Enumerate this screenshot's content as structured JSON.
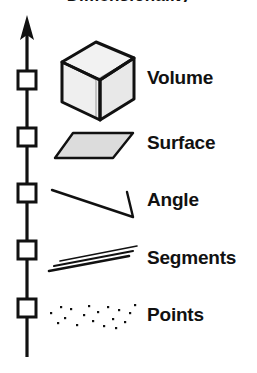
{
  "figure": {
    "title_cut_off": "Dimensionality",
    "axis": {
      "name": "vertical-hierarchy-arrow",
      "direction": "up",
      "tick_count": 5,
      "tick_shape": "square",
      "color": "#111111"
    },
    "rows": [
      {
        "label": "Volume",
        "icon": "cube-icon",
        "dimension": 3,
        "tick_y": 80
      },
      {
        "label": "Surface",
        "icon": "parallelogram-icon",
        "dimension": 2,
        "tick_y": 137
      },
      {
        "label": "Angle",
        "icon": "angle-icon",
        "dimension": 1,
        "tick_y": 193
      },
      {
        "label": "Segments",
        "icon": "line-segments-icon",
        "dimension": 1,
        "tick_y": 250
      },
      {
        "label": "Points",
        "icon": "point-cloud-icon",
        "dimension": 0,
        "tick_y": 308
      }
    ],
    "colors": {
      "stroke": "#111111",
      "fill_gray": "#d8d8d8",
      "background": "#ffffff"
    }
  }
}
